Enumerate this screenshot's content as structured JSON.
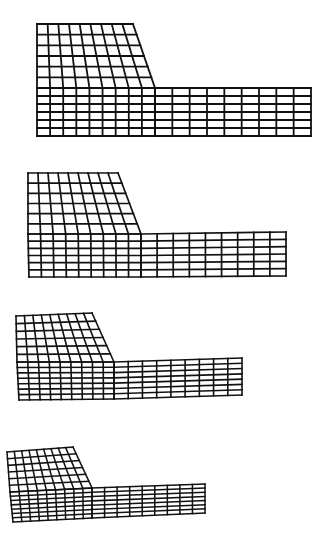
{
  "figure": {
    "line_color": "#111111",
    "background": "#ffffff",
    "meshes": [
      {
        "id": "mesh-1",
        "stroke_width": 1.8,
        "left_block": {
          "cols": 9,
          "upper_rows": 6,
          "lower_rows": 6,
          "top_left": [
            37,
            24
          ],
          "top_right": [
            133,
            24
          ],
          "mid_left": [
            37,
            88
          ],
          "mid_right": [
            155,
            88
          ],
          "bottom_left": [
            37,
            136
          ],
          "bottom_right": [
            155,
            136
          ]
        },
        "right_block": {
          "cols": 9,
          "rows": 6,
          "top_left": [
            155,
            88
          ],
          "top_right": [
            311,
            88
          ],
          "bottom_left": [
            155,
            136
          ],
          "bottom_right": [
            311,
            136
          ]
        }
      },
      {
        "id": "mesh-2",
        "stroke_width": 1.7,
        "left_block": {
          "cols": 9,
          "upper_rows": 6,
          "lower_rows": 6,
          "top_left": [
            28,
            173
          ],
          "top_right": [
            118,
            173
          ],
          "mid_left": [
            28,
            234
          ],
          "mid_right": [
            141,
            234
          ],
          "bottom_left": [
            29,
            277
          ],
          "bottom_right": [
            141,
            277
          ]
        },
        "right_block": {
          "cols": 9,
          "rows": 6,
          "top_left": [
            141,
            234
          ],
          "top_right": [
            286,
            232
          ],
          "bottom_left": [
            141,
            277
          ],
          "bottom_right": [
            286,
            276
          ]
        }
      },
      {
        "id": "mesh-3",
        "stroke_width": 1.6,
        "left_block": {
          "cols": 9,
          "upper_rows": 6,
          "lower_rows": 7,
          "top_left": [
            16,
            316
          ],
          "top_right": [
            92,
            313
          ],
          "mid_left": [
            17,
            362
          ],
          "mid_right": [
            114,
            362
          ],
          "bottom_left": [
            19,
            400
          ],
          "bottom_right": [
            114,
            399
          ]
        },
        "right_block": {
          "cols": 9,
          "rows": 7,
          "top_left": [
            114,
            362
          ],
          "top_right": [
            242,
            358
          ],
          "bottom_left": [
            114,
            399
          ],
          "bottom_right": [
            242,
            395
          ]
        }
      },
      {
        "id": "mesh-4",
        "stroke_width": 1.5,
        "left_block": {
          "cols": 9,
          "upper_rows": 6,
          "lower_rows": 7,
          "top_left": [
            7,
            452
          ],
          "top_right": [
            73,
            447
          ],
          "mid_left": [
            10,
            492
          ],
          "mid_right": [
            92,
            488
          ],
          "bottom_left": [
            13,
            522
          ],
          "bottom_right": [
            92,
            518
          ]
        },
        "right_block": {
          "cols": 9,
          "rows": 7,
          "top_left": [
            92,
            488
          ],
          "top_right": [
            205,
            484
          ],
          "bottom_left": [
            92,
            518
          ],
          "bottom_right": [
            205,
            513
          ]
        }
      }
    ]
  }
}
